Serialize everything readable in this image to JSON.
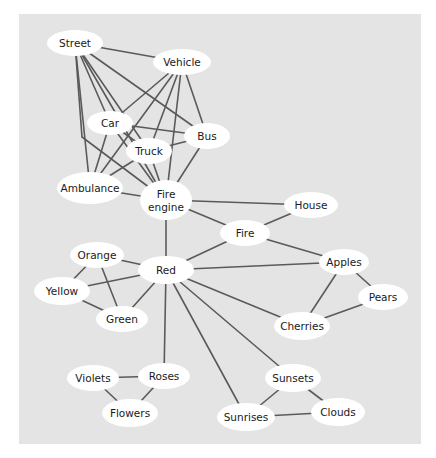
{
  "diagram": {
    "type": "semantic-network",
    "panel": {
      "x": 19,
      "y": 14,
      "width": 402,
      "height": 430,
      "fill": "#e4e4e4"
    },
    "colors": {
      "edge": "#5a5a5a",
      "node_fill": "#ffffff",
      "text": "#1a1a1a",
      "background": "#ffffff"
    },
    "nodes": [
      {
        "id": "street",
        "label": [
          "Street"
        ],
        "cx": 75,
        "cy": 43,
        "rx": 28,
        "ry": 13
      },
      {
        "id": "vehicle",
        "label": [
          "Vehicle"
        ],
        "cx": 182,
        "cy": 62,
        "rx": 29,
        "ry": 13
      },
      {
        "id": "car",
        "label": [
          "Car"
        ],
        "cx": 110,
        "cy": 123,
        "rx": 23,
        "ry": 12
      },
      {
        "id": "bus",
        "label": [
          "Bus"
        ],
        "cx": 207,
        "cy": 136,
        "rx": 23,
        "ry": 13
      },
      {
        "id": "truck",
        "label": [
          "Truck"
        ],
        "cx": 149,
        "cy": 151,
        "rx": 23,
        "ry": 13
      },
      {
        "id": "ambulance",
        "label": [
          "Ambulance"
        ],
        "cx": 90,
        "cy": 188,
        "rx": 33,
        "ry": 16
      },
      {
        "id": "fire_engine",
        "label": [
          "Fire",
          "engine"
        ],
        "cx": 166,
        "cy": 200,
        "rx": 26,
        "ry": 20
      },
      {
        "id": "house",
        "label": [
          "House"
        ],
        "cx": 311,
        "cy": 205,
        "rx": 27,
        "ry": 13
      },
      {
        "id": "fire",
        "label": [
          "Fire"
        ],
        "cx": 245,
        "cy": 233,
        "rx": 25,
        "ry": 13
      },
      {
        "id": "orange",
        "label": [
          "Orange"
        ],
        "cx": 97,
        "cy": 255,
        "rx": 27,
        "ry": 13
      },
      {
        "id": "red",
        "label": [
          "Red"
        ],
        "cx": 166,
        "cy": 270,
        "rx": 28,
        "ry": 14
      },
      {
        "id": "apples",
        "label": [
          "Apples"
        ],
        "cx": 344,
        "cy": 262,
        "rx": 25,
        "ry": 13
      },
      {
        "id": "yellow",
        "label": [
          "Yellow"
        ],
        "cx": 62,
        "cy": 291,
        "rx": 28,
        "ry": 14
      },
      {
        "id": "pears",
        "label": [
          "Pears"
        ],
        "cx": 383,
        "cy": 297,
        "rx": 25,
        "ry": 13
      },
      {
        "id": "green",
        "label": [
          "Green"
        ],
        "cx": 122,
        "cy": 319,
        "rx": 26,
        "ry": 13
      },
      {
        "id": "cherries",
        "label": [
          "Cherries"
        ],
        "cx": 302,
        "cy": 326,
        "rx": 28,
        "ry": 14
      },
      {
        "id": "violets",
        "label": [
          "Violets"
        ],
        "cx": 93,
        "cy": 378,
        "rx": 26,
        "ry": 13
      },
      {
        "id": "roses",
        "label": [
          "Roses"
        ],
        "cx": 164,
        "cy": 376,
        "rx": 26,
        "ry": 13
      },
      {
        "id": "sunsets",
        "label": [
          "Sunsets"
        ],
        "cx": 293,
        "cy": 378,
        "rx": 28,
        "ry": 14
      },
      {
        "id": "flowers",
        "label": [
          "Flowers"
        ],
        "cx": 130,
        "cy": 413,
        "rx": 28,
        "ry": 14
      },
      {
        "id": "clouds",
        "label": [
          "Clouds"
        ],
        "cx": 338,
        "cy": 412,
        "rx": 27,
        "ry": 14
      },
      {
        "id": "sunrises",
        "label": [
          "Sunrises"
        ],
        "cx": 246,
        "cy": 417,
        "rx": 29,
        "ry": 14
      }
    ],
    "edges": [
      {
        "from": "street",
        "to": "vehicle"
      },
      {
        "from": "street",
        "to": "ambulance"
      },
      {
        "from": "street",
        "to": "fire_engine",
        "via": [
          [
            82,
            137
          ]
        ]
      },
      {
        "from": "street",
        "to": "car"
      },
      {
        "from": "street",
        "to": "truck"
      },
      {
        "from": "street",
        "to": "bus"
      },
      {
        "from": "street",
        "to": "fire_engine"
      },
      {
        "from": "vehicle",
        "to": "car"
      },
      {
        "from": "vehicle",
        "to": "ambulance"
      },
      {
        "from": "vehicle",
        "to": "truck"
      },
      {
        "from": "vehicle",
        "to": "fire_engine"
      },
      {
        "from": "vehicle",
        "to": "bus"
      },
      {
        "from": "car",
        "to": "bus"
      },
      {
        "from": "car",
        "to": "truck"
      },
      {
        "from": "car",
        "to": "ambulance"
      },
      {
        "from": "car",
        "to": "fire_engine"
      },
      {
        "from": "truck",
        "to": "bus"
      },
      {
        "from": "truck",
        "to": "ambulance"
      },
      {
        "from": "truck",
        "to": "fire_engine"
      },
      {
        "from": "bus",
        "to": "fire_engine"
      },
      {
        "from": "ambulance",
        "to": "fire_engine"
      },
      {
        "from": "fire_engine",
        "to": "house"
      },
      {
        "from": "fire_engine",
        "to": "fire"
      },
      {
        "from": "fire_engine",
        "to": "red"
      },
      {
        "from": "fire",
        "to": "house"
      },
      {
        "from": "fire",
        "to": "red"
      },
      {
        "from": "fire",
        "to": "apples"
      },
      {
        "from": "red",
        "to": "orange"
      },
      {
        "from": "red",
        "to": "yellow"
      },
      {
        "from": "red",
        "to": "green"
      },
      {
        "from": "red",
        "to": "apples"
      },
      {
        "from": "red",
        "to": "cherries"
      },
      {
        "from": "red",
        "to": "roses"
      },
      {
        "from": "red",
        "to": "sunsets"
      },
      {
        "from": "red",
        "to": "sunrises"
      },
      {
        "from": "orange",
        "to": "yellow"
      },
      {
        "from": "orange",
        "to": "green"
      },
      {
        "from": "yellow",
        "to": "green"
      },
      {
        "from": "apples",
        "to": "pears"
      },
      {
        "from": "apples",
        "to": "cherries"
      },
      {
        "from": "pears",
        "to": "cherries"
      },
      {
        "from": "violets",
        "to": "roses"
      },
      {
        "from": "violets",
        "to": "flowers"
      },
      {
        "from": "roses",
        "to": "flowers"
      },
      {
        "from": "sunsets",
        "to": "sunrises"
      },
      {
        "from": "sunsets",
        "to": "clouds"
      },
      {
        "from": "sunrises",
        "to": "clouds"
      }
    ]
  }
}
